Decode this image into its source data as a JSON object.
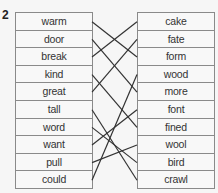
{
  "exercise_number": "2",
  "left_words": [
    "warm",
    "door",
    "break",
    "kind",
    "great",
    "tall",
    "word",
    "want",
    "pull",
    "could"
  ],
  "right_words": [
    "cake",
    "fate",
    "form",
    "wood",
    "more",
    "font",
    "fined",
    "wool",
    "bird",
    "crawl"
  ],
  "connections": [
    {
      "left": "warm",
      "right": "form"
    },
    {
      "left": "door",
      "right": "more"
    },
    {
      "left": "break",
      "right": "cake"
    },
    {
      "left": "kind",
      "right": "fined"
    },
    {
      "left": "great",
      "right": "fate"
    },
    {
      "left": "tall",
      "right": "crawl"
    },
    {
      "left": "word",
      "right": "bird"
    },
    {
      "left": "want",
      "right": "font"
    },
    {
      "left": "pull",
      "right": "wool"
    },
    {
      "left": "could",
      "right": "wood"
    }
  ],
  "line_color": "#333333",
  "border_color": "#8a8a8a"
}
